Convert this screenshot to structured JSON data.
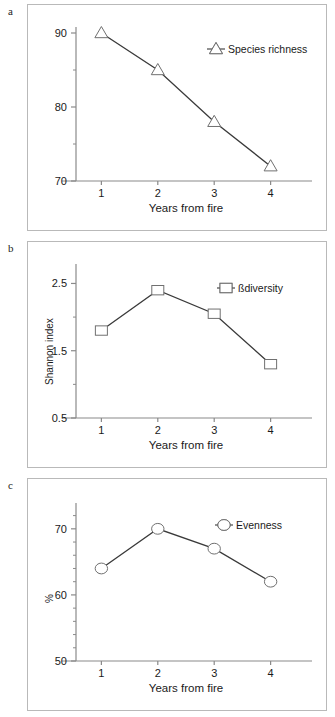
{
  "figure": {
    "panels": [
      {
        "letter": "a",
        "xlabel": "Years from fire",
        "ylabel": "",
        "legend": "Species richness",
        "marker": "triangle",
        "ymin": 70,
        "ymax": 90,
        "yticks": [
          70,
          80,
          90
        ],
        "yticklabels": [
          "70",
          "80",
          "90"
        ],
        "yminorticks": [
          75,
          85
        ],
        "xticks": [
          1,
          2,
          3,
          4
        ],
        "xticklabels": [
          "1",
          "2",
          "3",
          "4"
        ]
      },
      {
        "letter": "b",
        "xlabel": "Years from fire",
        "ylabel": "Shannon index",
        "legend": "ßdiversity",
        "marker": "square",
        "ymin": 0.5,
        "ymax": 2.7,
        "yticks": [
          0.5,
          1.5,
          2.5
        ],
        "yticklabels": [
          "0.5",
          "1.5",
          "2.5"
        ],
        "yminorticks": [
          1.0,
          2.0
        ],
        "xticks": [
          1,
          2,
          3,
          4
        ],
        "xticklabels": [
          "1",
          "2",
          "3",
          "4"
        ]
      },
      {
        "letter": "c",
        "xlabel": "Years from fire",
        "ylabel": "%",
        "legend": "Evenness",
        "marker": "circle",
        "ymin": 50,
        "ymax": 73,
        "yticks": [
          50,
          60,
          70
        ],
        "yticklabels": [
          "50",
          "60",
          "70"
        ],
        "yminorticks": [
          52,
          54,
          56,
          58,
          62,
          64,
          66,
          68,
          72
        ],
        "xticks": [
          1,
          2,
          3,
          4
        ],
        "xticklabels": [
          "1",
          "2",
          "3",
          "4"
        ]
      }
    ]
  },
  "chart_data": [
    {
      "type": "line",
      "title": "a",
      "xlabel": "Years from fire",
      "ylabel": "",
      "legend": [
        "Species richness"
      ],
      "legend_position": "top-right",
      "grid": false,
      "marker": "triangle",
      "x": [
        1,
        2,
        3,
        4
      ],
      "categories": [
        "1",
        "2",
        "3",
        "4"
      ],
      "values": [
        90,
        85,
        78,
        72
      ],
      "series": [
        {
          "name": "Species richness",
          "values": [
            90,
            85,
            78,
            72
          ]
        }
      ],
      "xlim": [
        0.55,
        4.45
      ],
      "ylim": [
        70,
        90
      ],
      "yticks": [
        70,
        80,
        90
      ]
    },
    {
      "type": "line",
      "title": "b",
      "xlabel": "Years from fire",
      "ylabel": "Shannon index",
      "legend": [
        "ßdiversity"
      ],
      "legend_position": "top-right",
      "grid": false,
      "marker": "square",
      "x": [
        1,
        2,
        3,
        4
      ],
      "categories": [
        "1",
        "2",
        "3",
        "4"
      ],
      "values": [
        1.8,
        2.4,
        2.05,
        1.3
      ],
      "series": [
        {
          "name": "ßdiversity",
          "values": [
            1.8,
            2.4,
            2.05,
            1.3
          ]
        }
      ],
      "xlim": [
        0.55,
        4.45
      ],
      "ylim": [
        0.5,
        2.7
      ],
      "yticks": [
        0.5,
        1.5,
        2.5
      ]
    },
    {
      "type": "line",
      "title": "c",
      "xlabel": "Years from fire",
      "ylabel": "%",
      "legend": [
        "Evenness"
      ],
      "legend_position": "top-right",
      "grid": false,
      "marker": "circle",
      "x": [
        1,
        2,
        3,
        4
      ],
      "categories": [
        "1",
        "2",
        "3",
        "4"
      ],
      "values": [
        64,
        70,
        67,
        62
      ],
      "series": [
        {
          "name": "Evenness",
          "values": [
            64,
            70,
            67,
            62
          ]
        }
      ],
      "xlim": [
        0.55,
        4.45
      ],
      "ylim": [
        50,
        73
      ],
      "yticks": [
        50,
        60,
        70
      ]
    }
  ],
  "colors": {
    "line": "#3a3a3a",
    "marker_stroke": "#707070",
    "axis": "#8a8a8a",
    "text": "#1a1a1a",
    "panel_border": "#b9b9b9",
    "background": "#ffffff"
  }
}
